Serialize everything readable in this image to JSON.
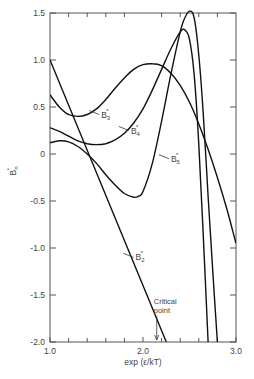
{
  "chart_data": {
    "type": "line",
    "title": "",
    "xlabel": "exp (ε/kT)",
    "ylabel": "B",
    "ylabel_sub": "n",
    "ylabel_sup": "*",
    "xlim": [
      1.0,
      3.0
    ],
    "ylim": [
      -2.0,
      1.5
    ],
    "x_ticks": [
      1.0,
      2.0,
      3.0
    ],
    "x_tick_labels": [
      "1.0",
      "2.0",
      "3.0"
    ],
    "x_minor_ticks": [
      1.2,
      1.4,
      1.6,
      1.8,
      2.2,
      2.4,
      2.6,
      2.8
    ],
    "y_ticks": [
      1.5,
      1.0,
      0.5,
      0,
      -0.5,
      -1.0,
      -1.5,
      -2.0
    ],
    "y_tick_labels": [
      "1.5",
      "1.0",
      "0.5",
      "0",
      "-0.5",
      "-1.0",
      "-1.5",
      "-2.0"
    ],
    "grid": false,
    "legend": "inline labels",
    "series": [
      {
        "name": "B2*",
        "label": "B",
        "sub": "2",
        "x": [
          1.0,
          1.5,
          2.0,
          2.25
        ],
        "y": [
          1.0,
          -0.2,
          -1.4,
          -2.0
        ],
        "label_at": [
          1.92,
          -1.1
        ]
      },
      {
        "name": "B3*",
        "label": "B",
        "sub": "3",
        "x": [
          1.0,
          1.1,
          1.2,
          1.3,
          1.4,
          1.5,
          1.6,
          1.7,
          1.8,
          1.9,
          2.0,
          2.1,
          2.2,
          2.3,
          2.4,
          2.5,
          2.6,
          2.7,
          2.8,
          2.9,
          3.0
        ],
        "y": [
          0.63,
          0.5,
          0.42,
          0.4,
          0.42,
          0.48,
          0.58,
          0.7,
          0.81,
          0.9,
          0.95,
          0.96,
          0.94,
          0.86,
          0.73,
          0.55,
          0.32,
          0.05,
          -0.25,
          -0.58,
          -0.95
        ],
        "label_at": [
          1.55,
          0.42
        ]
      },
      {
        "name": "B4*",
        "label": "B",
        "sub": "4",
        "x": [
          1.0,
          1.1,
          1.2,
          1.3,
          1.4,
          1.5,
          1.6,
          1.7,
          1.8,
          1.9,
          2.0,
          2.1,
          2.2,
          2.3,
          2.4,
          2.45,
          2.5,
          2.55,
          2.6,
          2.65,
          2.7
        ],
        "y": [
          0.28,
          0.24,
          0.19,
          0.14,
          0.11,
          0.1,
          0.11,
          0.15,
          0.22,
          0.33,
          0.48,
          0.68,
          0.9,
          1.12,
          1.3,
          1.32,
          1.22,
          0.85,
          0.1,
          -0.9,
          -2.0
        ],
        "label_at": [
          1.87,
          0.25
        ]
      },
      {
        "name": "B5*",
        "label": "B",
        "sub": "5",
        "x": [
          1.0,
          1.1,
          1.2,
          1.3,
          1.4,
          1.5,
          1.6,
          1.7,
          1.8,
          1.9,
          1.95,
          2.0,
          2.1,
          2.2,
          2.3,
          2.4,
          2.45,
          2.5,
          2.55,
          2.6,
          2.65,
          2.7,
          2.75,
          2.8
        ],
        "y": [
          0.12,
          0.14,
          0.13,
          0.08,
          0.0,
          -0.1,
          -0.22,
          -0.33,
          -0.42,
          -0.46,
          -0.45,
          -0.4,
          -0.1,
          0.35,
          0.85,
          1.3,
          1.45,
          1.52,
          1.45,
          1.05,
          0.4,
          -0.45,
          -1.25,
          -2.0
        ],
        "label_at": [
          2.3,
          -0.05
        ]
      }
    ],
    "annotations": [
      {
        "text_lines": [
          "Critical",
          "point"
        ],
        "x": 2.18,
        "y": -1.68,
        "arrow_to": [
          2.18,
          -2.0
        ]
      }
    ]
  }
}
